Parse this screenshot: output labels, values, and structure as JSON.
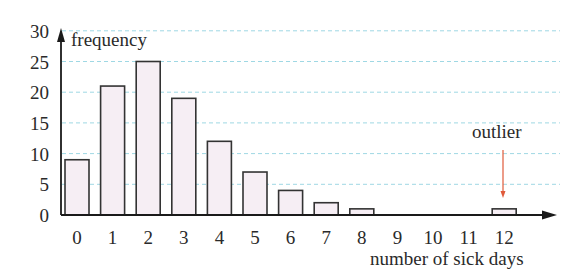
{
  "chart_data": {
    "type": "bar",
    "title": "",
    "xlabel": "number of sick days",
    "ylabel": "frequency",
    "categories": [
      "0",
      "1",
      "2",
      "3",
      "4",
      "5",
      "6",
      "7",
      "8",
      "9",
      "10",
      "11",
      "12"
    ],
    "values": [
      9,
      21,
      25,
      19,
      12,
      7,
      4,
      2,
      1,
      0,
      0,
      0,
      1
    ],
    "yticks": [
      0,
      5,
      10,
      15,
      20,
      25,
      30
    ],
    "ylim": [
      0,
      30
    ],
    "grid": true,
    "grid_style": "dashed, light cyan, horizontal",
    "annotations": [
      {
        "text": "outlier",
        "target_category": "12",
        "arrow_color": "#e05a3a"
      }
    ],
    "colors": {
      "bar_fill": "#f6eef4",
      "bar_stroke": "#333333",
      "grid": "#9fd8e4",
      "axis": "#1a1a1a"
    }
  }
}
